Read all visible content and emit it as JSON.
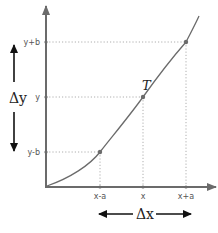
{
  "diagram": {
    "type": "derivative-difference-quotient",
    "x_axis": {
      "ticks": [
        {
          "label": "x-a",
          "px": 100
        },
        {
          "label": "x",
          "px": 143
        },
        {
          "label": "x+a",
          "px": 186
        }
      ]
    },
    "y_axis": {
      "ticks": [
        {
          "label": "y+b",
          "py": 42
        },
        {
          "label": "y",
          "py": 97
        },
        {
          "label": "y-b",
          "py": 152
        }
      ]
    },
    "point": {
      "label": "T"
    },
    "delta_x": {
      "label": "Δx"
    },
    "delta_y": {
      "label": "Δy"
    },
    "colors": {
      "axis": "#6b6b6b",
      "curve": "#6b6b6b",
      "guide": "#9a9a9a",
      "arrow": "#111111",
      "text": "#222222"
    }
  }
}
